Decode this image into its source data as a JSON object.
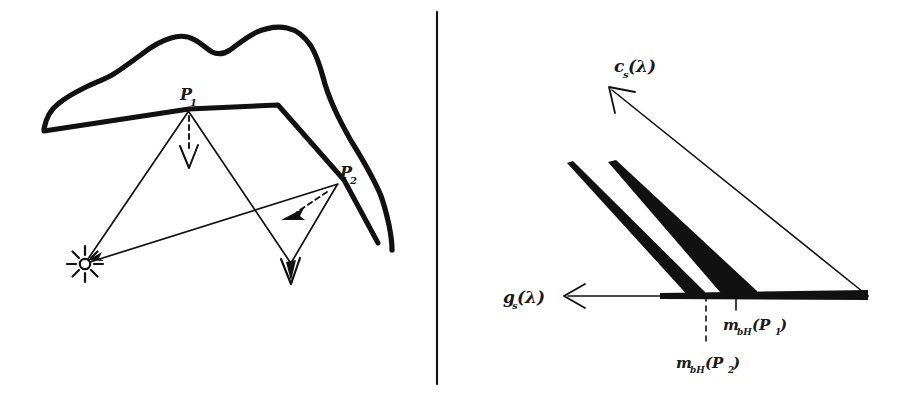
{
  "figure": {
    "type": "hand-drawn-scientific-diagram",
    "background_color": "#ffffff",
    "ink_color": "#111111",
    "divider": {
      "name": "vertical-divider",
      "orientation": "vertical",
      "x": 437,
      "y_top": 12,
      "y_bottom": 384
    },
    "panels": [
      {
        "id": "left",
        "name": "surface-reflection-geometry",
        "description": "Irregular blob (surface patch) with a bent facet, a point light source and reflected rays to two surface points P1 and P2 with their surface normals drawn as dashed arrows.",
        "labels": {
          "point_1": "P",
          "point_1_sub": "1",
          "point_2": "P",
          "point_2_sub": "2"
        },
        "icons": {
          "light_source": "sun-star-icon"
        }
      },
      {
        "id": "right",
        "name": "spectral-axes-diagram",
        "description": "Two axes drawn as arrows from a common corner: a horizontal axis pointing left and a diagonal axis pointing up-left. Two thick tapered wedges run from the corner region up-left. Tick marks on the horizontal axis are labelled with the body-colour maps of P1 and P2.",
        "labels": {
          "axis_diagonal": "c",
          "axis_diagonal_sub": "s",
          "axis_diagonal_arg": "(λ)",
          "axis_horizontal": "g",
          "axis_horizontal_sub": "s",
          "axis_horizontal_arg": "(λ)",
          "tick_1": "m",
          "tick_1_sub": "bH",
          "tick_1_arg": "(P",
          "tick_1_argsub": "1",
          "tick_1_close": ")",
          "tick_2": "m",
          "tick_2_sub": "bH",
          "tick_2_arg": "(P",
          "tick_2_argsub": "2",
          "tick_2_close": ")"
        }
      }
    ]
  }
}
